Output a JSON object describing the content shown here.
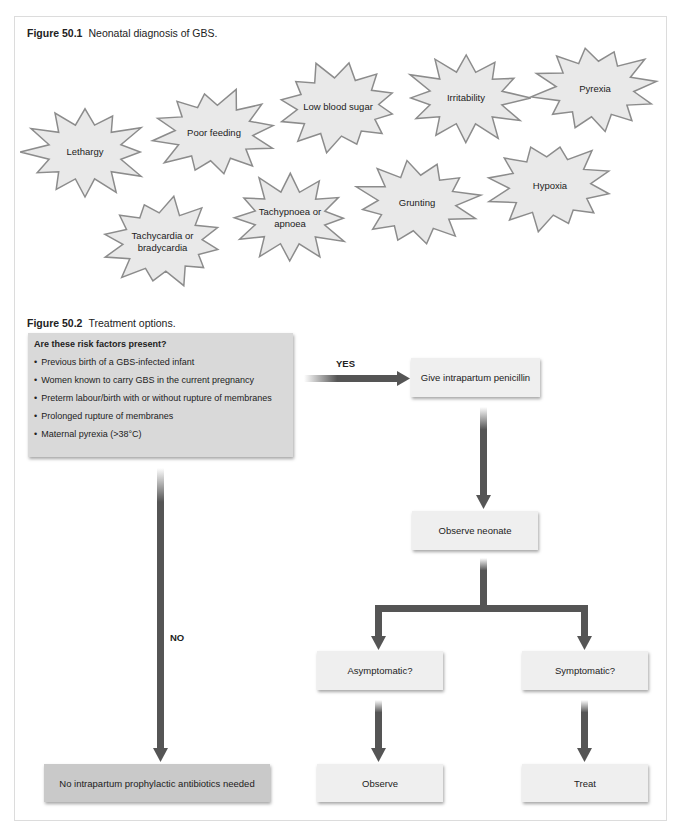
{
  "figure1": {
    "number": "Figure 50.1",
    "caption": "Neonatal diagnosis of GBS.",
    "symptoms": [
      {
        "label": "Lethargy",
        "x": 25,
        "y": 107,
        "w": 120,
        "h": 90
      },
      {
        "label": "Poor feeding",
        "x": 154,
        "y": 90,
        "w": 120,
        "h": 86
      },
      {
        "label": "Low blood sugar",
        "x": 278,
        "y": 64,
        "w": 120,
        "h": 86
      },
      {
        "label": "Irritability",
        "x": 406,
        "y": 55,
        "w": 120,
        "h": 86
      },
      {
        "label": "Pyrexia",
        "x": 535,
        "y": 46,
        "w": 120,
        "h": 86
      },
      {
        "label": "Tachycardia or bradycardia",
        "x": 104,
        "y": 199,
        "w": 117,
        "h": 86
      },
      {
        "label": "Tachypnoea or apnoea",
        "x": 232,
        "y": 175,
        "w": 116,
        "h": 86
      },
      {
        "label": "Grunting",
        "x": 357,
        "y": 160,
        "w": 120,
        "h": 86
      },
      {
        "label": "Hypoxia",
        "x": 490,
        "y": 143,
        "w": 120,
        "h": 86
      }
    ],
    "burst_fill": "#e9e9e9",
    "burst_stroke": "#8c8c8c"
  },
  "figure2": {
    "number": "Figure 50.2",
    "caption": "Treatment options.",
    "risk_box": {
      "title": "Are these risk factors present?",
      "items": [
        "Previous birth of a GBS-infected infant",
        "Women known to carry GBS in the current pregnancy",
        "Preterm labour/birth with or without rupture of membranes",
        "Prolonged rupture of membranes",
        "Maternal pyrexia (>38°C)"
      ]
    },
    "yes_label": "YES",
    "no_label": "NO",
    "nodes": {
      "penicillin": "Give intrapartum penicillin",
      "observe_neonate": "Observe neonate",
      "asymptomatic": "Asymptomatic?",
      "symptomatic": "Symptomatic?",
      "observe": "Observe",
      "treat": "Treat",
      "no_antibiotics": "No intrapartum prophylactic antibiotics needed"
    },
    "arrow_color": "#555555"
  }
}
